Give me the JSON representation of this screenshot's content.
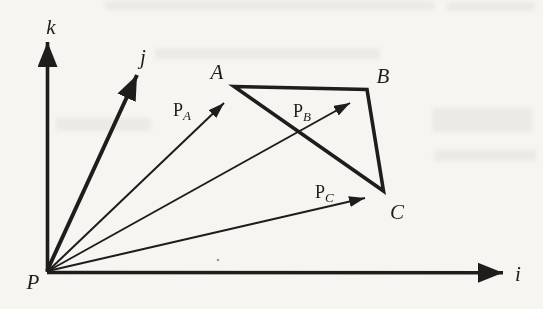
{
  "figure": {
    "colors": {
      "ink": "#1e1d1b",
      "paper": "#f6f5f1"
    },
    "axis_labels": {
      "i": "i",
      "j": "j",
      "k": "k"
    },
    "origin_label": "P",
    "triangle_vertices": {
      "a": "A",
      "b": "B",
      "c": "C"
    },
    "position_vectors": {
      "pa": {
        "main": "P",
        "sub": "A"
      },
      "pb": {
        "main": "P",
        "sub": "B"
      },
      "pc": {
        "main": "P",
        "sub": "C"
      }
    }
  }
}
